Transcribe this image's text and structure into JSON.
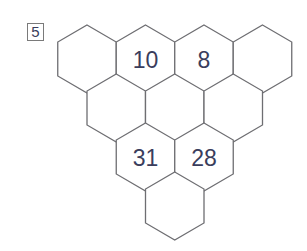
{
  "puzzle": {
    "number_label": "5",
    "colors": {
      "line": "#6e6e72",
      "text": "#3a3d5c",
      "background": "#ffffff"
    },
    "rows": [
      {
        "cells": [
          "",
          "10",
          "8",
          ""
        ]
      },
      {
        "cells": [
          "",
          "",
          ""
        ]
      },
      {
        "cells": [
          "31",
          "28"
        ]
      },
      {
        "cells": [
          ""
        ]
      }
    ]
  }
}
